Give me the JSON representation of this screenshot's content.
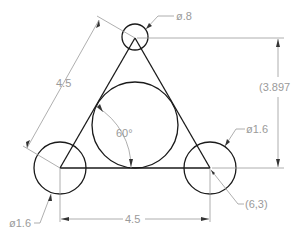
{
  "drawing": {
    "type": "engineering-sketch",
    "labels": {
      "side_length_left": "4.5",
      "side_length_bottom": "4.5",
      "height": "(3.897",
      "angle": "60°",
      "top_circle_diameter": "ø.8",
      "right_circle_diameter": "ø1.6",
      "left_circle_diameter": "ø1.6",
      "vertex_coordinate": "(6,3)"
    },
    "colors": {
      "geometry": "#1a1a1a",
      "dimension": "#9a9a9a"
    }
  }
}
